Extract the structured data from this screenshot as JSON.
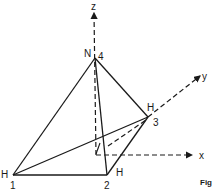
{
  "diagram": {
    "axes": {
      "z": {
        "label": "z"
      },
      "y": {
        "label": "y"
      },
      "x": {
        "label": "x"
      }
    },
    "atoms": [
      {
        "element": "H",
        "index": "1"
      },
      {
        "element": "H",
        "index": "2"
      },
      {
        "element": "H",
        "index": "3"
      },
      {
        "element": "N",
        "index": "4"
      }
    ],
    "caption_fragment": "Fig"
  }
}
